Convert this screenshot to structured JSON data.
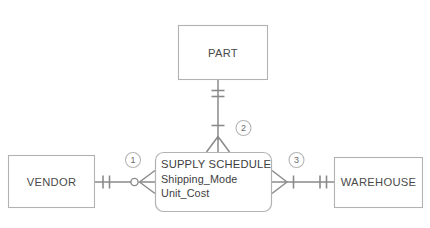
{
  "diagram": {
    "type": "entity-relationship-diagram",
    "notation": "crow's foot",
    "entities": [
      {
        "id": "part",
        "label": "PART"
      },
      {
        "id": "vendor",
        "label": "VENDOR"
      },
      {
        "id": "warehouse",
        "label": "WAREHOUSE"
      }
    ],
    "associative_entity": {
      "id": "supply-schedule",
      "title": "SUPPLY SCHEDULE",
      "attributes": [
        "Shipping_Mode",
        "Unit_Cost"
      ]
    },
    "relationship_badges": [
      {
        "id": "badge-1",
        "label": "1"
      },
      {
        "id": "badge-2",
        "label": "2"
      },
      {
        "id": "badge-3",
        "label": "3"
      }
    ],
    "colors": {
      "entity_border": "#b2b2b2",
      "connector": "#8a8a8a",
      "text": "#3d3d3d",
      "background": "#ffffff"
    }
  }
}
